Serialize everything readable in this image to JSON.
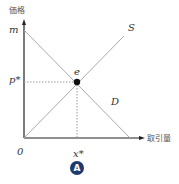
{
  "diagram": {
    "type": "supply-demand",
    "y_axis_label": "価格",
    "x_axis_label": "取引量",
    "origin_label": "0",
    "y_intercept_label": "m",
    "equilibrium_price_label": "p*",
    "equilibrium_quantity_label": "x*",
    "equilibrium_point_label": "e",
    "supply_label": "S",
    "demand_label": "D",
    "figure_badge": "A"
  }
}
